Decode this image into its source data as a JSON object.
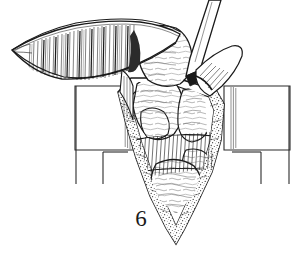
{
  "figure": {
    "caption_number": "6",
    "type": "line-art surgical illustration",
    "background_color": "#ffffff",
    "ink_color": "#1a1a1a",
    "tone_light": "#8a8a8a",
    "tone_mid": "#555555"
  },
  "elements": {
    "flap": {
      "name": "reflected-tissue-flap",
      "description": "Elongated pointed flap retracted to the upper left with dense vertical fiber hatching on its undersurface",
      "tip_x": 12,
      "tip_y": 50
    },
    "instrument": {
      "name": "probe-instrument",
      "description": "Narrow tapering blade entering the field from the upper right"
    },
    "retractor_left": {
      "name": "retractor-blade-left",
      "description": "Rectangular retractor blade with vertical striations on its inner edge and two descending handle shafts"
    },
    "retractor_right": {
      "name": "retractor-blade-right",
      "description": "Mirror-image rectangular retractor blade with vertical striations and two descending handle shafts"
    },
    "wound_cavity": {
      "name": "wound-cavity",
      "description": "Deep V-shaped wound cavity bounded by stippled subcutaneous fat layers converging at a pointed apex"
    },
    "tissue_masses": {
      "name": "exposed-tissue-masses",
      "count": 5,
      "description": "Lobulated tissue masses with fine squiggle texture filling the depth of the wound"
    },
    "muscle_fibers": {
      "name": "muscle-fiber-hatching",
      "description": "Radiating fine parallel hatch lines representing cut muscle fibers across the mid wound"
    }
  }
}
